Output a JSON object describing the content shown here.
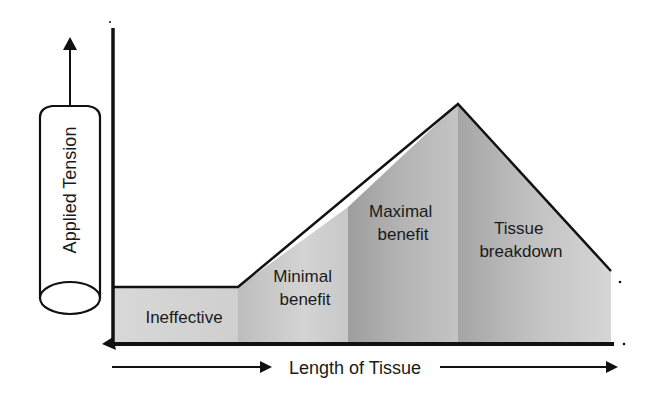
{
  "diagram": {
    "y_axis_label": "Applied Tension",
    "x_axis_label": "Length of Tissue",
    "regions": [
      {
        "name": "ineffective",
        "lines": [
          "Ineffective"
        ],
        "shade": "#d2d2d2"
      },
      {
        "name": "minimal-benefit",
        "lines": [
          "Minimal",
          "benefit"
        ],
        "shade": "#c2c2c2"
      },
      {
        "name": "maximal-benefit",
        "lines": [
          "Maximal",
          "benefit"
        ],
        "shade": "#a9a9a9"
      },
      {
        "name": "tissue-breakdown",
        "lines": [
          "Tissue",
          "breakdown"
        ],
        "shade": "#bdbdbd"
      }
    ],
    "colors": {
      "line": "#111111",
      "text": "#1a1a1a",
      "background": "#ffffff"
    }
  }
}
